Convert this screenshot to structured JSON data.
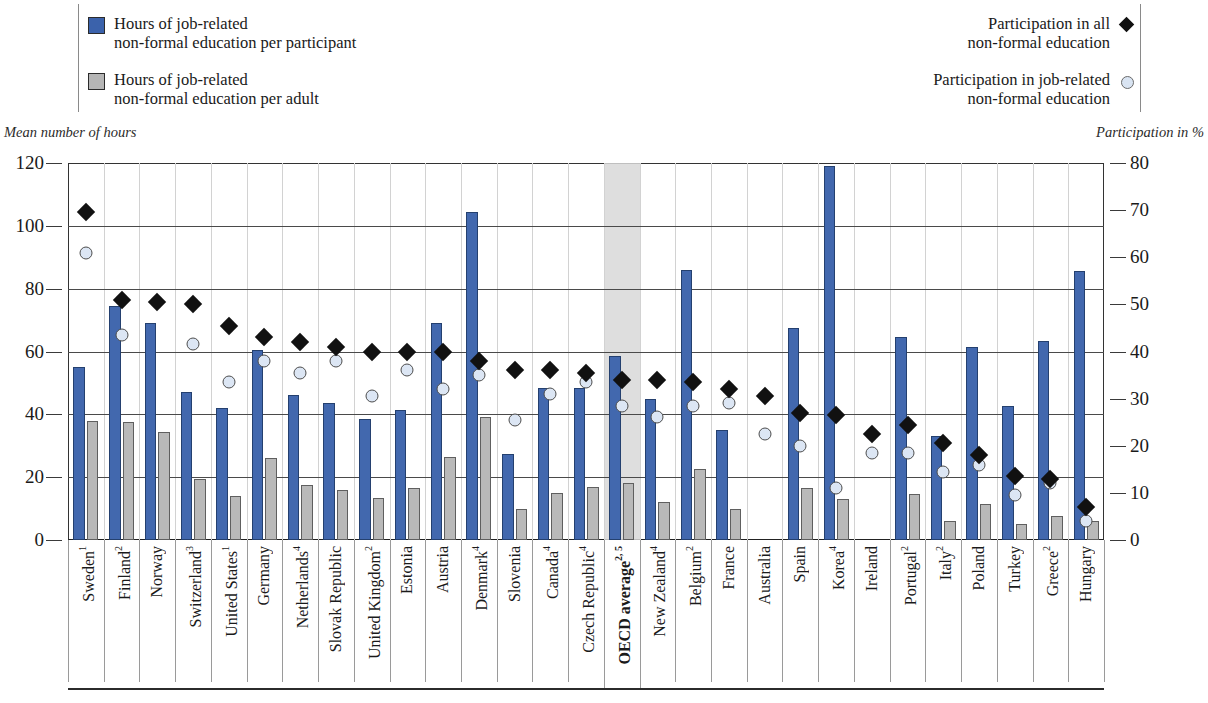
{
  "legend": {
    "left_items": [
      {
        "marker": "blue-square",
        "line1": "Hours of job-related",
        "line2": "non-formal education per participant"
      },
      {
        "marker": "grey-square",
        "line1": "Hours of job-related",
        "line2": "non-formal education per adult"
      }
    ],
    "right_items": [
      {
        "marker": "black-diamond",
        "line1": "Participation in all",
        "line2": "non-formal education"
      },
      {
        "marker": "light-circle",
        "line1": "Participation in job-related",
        "line2": "non-formal education"
      }
    ]
  },
  "axes": {
    "left_caption": "Mean number of hours",
    "right_caption": "Participation in %",
    "left_ticks": [
      0,
      20,
      40,
      60,
      80,
      100,
      120
    ],
    "right_ticks": [
      0,
      10,
      20,
      30,
      40,
      50,
      60,
      70,
      80
    ]
  },
  "colors": {
    "bar_participant": "#4268ae",
    "bar_adult": "#b9b9b9",
    "marker_all": "#111111",
    "marker_jobrelated": "#dce6f4",
    "highlight_band": "#d8d8d8"
  },
  "chart_data": {
    "type": "bar",
    "title": "",
    "xlabel": "",
    "ylabel": "Mean number of hours",
    "ylabel_right": "Participation in %",
    "ylim": [
      0,
      120
    ],
    "ylim_right": [
      0,
      80
    ],
    "grid": true,
    "legend_position": "top",
    "highlight_category": "OECD average",
    "categories": [
      "Sweden",
      "Finland",
      "Norway",
      "Switzerland",
      "United States",
      "Germany",
      "Netherlands",
      "Slovak Republic",
      "United Kingdom",
      "Estonia",
      "Austria",
      "Denmark",
      "Slovenia",
      "Canada",
      "Czech Republic",
      "OECD average",
      "New Zealand",
      "Belgium",
      "France",
      "Australia",
      "Spain",
      "Korea",
      "Ireland",
      "Portugal",
      "Italy",
      "Poland",
      "Turkey",
      "Greece",
      "Hungary"
    ],
    "category_footnotes": [
      "1",
      "2",
      "",
      "3",
      "1",
      "",
      "4",
      "",
      "2",
      "",
      "",
      "4",
      "",
      "4",
      "4",
      "2, 5",
      "4",
      "2",
      "",
      "",
      "",
      "4",
      "",
      "2",
      "2",
      "",
      "",
      "2",
      ""
    ],
    "series": [
      {
        "name": "Hours of job-related non-formal education per participant",
        "axis": "left",
        "unit": "hours",
        "values": [
          55,
          74.5,
          69,
          47,
          42,
          60.5,
          46,
          43.5,
          38.5,
          41.5,
          69,
          104.5,
          27.5,
          48.5,
          48.5,
          58.5,
          45,
          86,
          35,
          null,
          67.5,
          119,
          null,
          64.5,
          33,
          61.5,
          42.5,
          63.5,
          85.5
        ]
      },
      {
        "name": "Hours of job-related non-formal education per adult",
        "axis": "left",
        "unit": "hours",
        "values": [
          38,
          37.5,
          34.5,
          19.5,
          14,
          26,
          17.5,
          16,
          13.5,
          16.5,
          26.5,
          39,
          10,
          15,
          17,
          18,
          12,
          22.5,
          10,
          null,
          16.5,
          13,
          null,
          14.5,
          6,
          11.5,
          5,
          7.5,
          6
        ]
      },
      {
        "name": "Participation in all non-formal education",
        "axis": "right",
        "unit": "%",
        "values": [
          69.5,
          51,
          50.5,
          50,
          45.5,
          43,
          42,
          41,
          40,
          40,
          40,
          38,
          36,
          36,
          35.5,
          34,
          34,
          33.5,
          32,
          30.5,
          27,
          26.5,
          22.5,
          24.5,
          20.5,
          18,
          13.5,
          13,
          7
        ]
      },
      {
        "name": "Participation in job-related non-formal education",
        "axis": "right",
        "unit": "%",
        "values": [
          61,
          43.5,
          null,
          41.5,
          33.5,
          38,
          35.5,
          38,
          30.5,
          36,
          32,
          35,
          25.5,
          31,
          33.5,
          28.5,
          26,
          28.5,
          29,
          22.5,
          20,
          11,
          18.5,
          18.5,
          14.5,
          16,
          9.5,
          12,
          4
        ]
      }
    ]
  }
}
